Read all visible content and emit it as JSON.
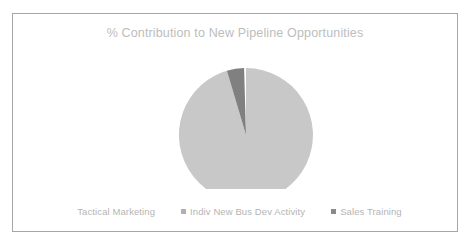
{
  "chart_data": {
    "type": "pie",
    "title": "% Contribution to New Pipeline Opportunities",
    "categories": [
      "Tactical Marketing",
      "Indiv New Bus Dev Activity",
      "Sales Training"
    ],
    "values": [
      92,
      1,
      7
    ],
    "unit": "%",
    "colors": [
      "#c8c8c8",
      "#ffffff",
      "#808080"
    ],
    "legend_position": "bottom",
    "grid": false,
    "xlabel": "",
    "ylabel": "",
    "slices": [
      {
        "label": "Tactical Marketing",
        "value": 92,
        "color": "#c8c8c8",
        "start_angle": 12,
        "end_angle": 343,
        "path": "M 91 91 L 91 24 A 67 67 0 1 1 76.4 25.6 Z"
      },
      {
        "label": "Indiv New Bus Dev Activity",
        "value": 1,
        "color": "#ffffff",
        "start_angle": 343,
        "end_angle": 347,
        "path": "M 91 91 L 76.4 25.6 A 67 67 0 0 1 71.9 26.8 Z"
      },
      {
        "label": "Sales Training",
        "value": 7,
        "color": "#808080",
        "start_angle": 347,
        "end_angle": 12,
        "path": "M 91 91 L 71.9 26.8 A 67 67 0 0 1 89.1 24.0 Z"
      }
    ]
  },
  "legend": {
    "items": [
      {
        "label": "Tactical Marketing",
        "color": "#ffffff"
      },
      {
        "label": "Indiv New Bus Dev Activity",
        "color": "#b0b0b0"
      },
      {
        "label": "Sales Training",
        "color": "#8a8a8a"
      }
    ]
  }
}
